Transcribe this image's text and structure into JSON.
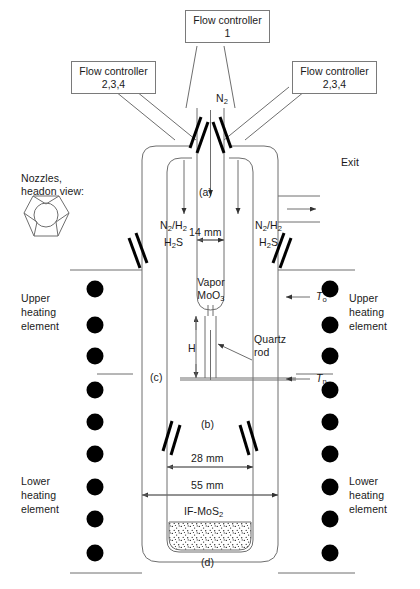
{
  "figure": {
    "type": "apparatus-diagram"
  },
  "flow_controllers": {
    "top": {
      "line1": "Flow controller",
      "line2": "1"
    },
    "left": {
      "line1": "Flow controller",
      "line2": "2,3,4"
    },
    "right": {
      "line1": "Flow controller",
      "line2": "2,3,4"
    }
  },
  "gas_labels": {
    "center_carrier": "N2",
    "left_mix_line1": "N2/H2",
    "left_mix_line2": "H2S",
    "right_mix_line1": "N2/H2",
    "right_mix_line2": "H2S",
    "exit": "Exit"
  },
  "nozzle_inset": {
    "line1": "Nozzles,",
    "line2": "headon view:"
  },
  "heating": {
    "upper_left": "Upper\nheating\nelement",
    "upper_right": "Upper\nheating\nelement",
    "lower_left": "Lower\nheating\nelement",
    "lower_right": "Lower\nheating\nelement",
    "upper_left_lines": [
      "Upper",
      "heating",
      "element"
    ],
    "lower_left_lines": [
      "Lower",
      "heating",
      "element"
    ],
    "upper_right_lines": [
      "Upper",
      "heating",
      "element"
    ],
    "lower_right_lines": [
      "Lower",
      "heating",
      "element"
    ],
    "upper_element_count": 3,
    "lower_element_count": 6
  },
  "reactor": {
    "vapor_line1": "Vapor",
    "vapor_line2": "MoO3",
    "quartz_rod_line1": "Quartz",
    "quartz_rod_line2": "rod",
    "product": "IF-MoS2"
  },
  "dimensions": {
    "inner_tube": "14 mm",
    "middle_tube": "28 mm",
    "outer_tube": "55 mm",
    "height_symbol": "H"
  },
  "temperatures": {
    "top": "To",
    "bottom": "Tn",
    "top_symbol": "T",
    "top_sub": "o",
    "bottom_symbol": "T",
    "bottom_sub": "n"
  },
  "zone_markers": {
    "a": "(a)",
    "b": "(b)",
    "c": "(c)",
    "d": "(d)"
  },
  "colors": {
    "line": "#6e6e6e",
    "heavy": "#000000",
    "text": "#1a1a1a",
    "background": "#ffffff"
  }
}
